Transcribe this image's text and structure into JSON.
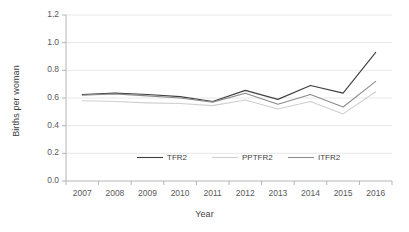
{
  "chart_data": {
    "type": "line",
    "title": "",
    "xlabel": "Year",
    "ylabel": "Births per woman",
    "categories": [
      "2007",
      "2008",
      "2009",
      "2010",
      "2011",
      "2012",
      "2013",
      "2014",
      "2015",
      "2016"
    ],
    "x": [
      2007,
      2008,
      2009,
      2010,
      2011,
      2012,
      2013,
      2014,
      2015,
      2016
    ],
    "ylim": [
      0.0,
      1.2
    ],
    "ytick_labels": [
      "0.0",
      "0.2",
      "0.4",
      "0.6",
      "0.8",
      "1.0",
      "1.2"
    ],
    "ytick_values": [
      0.0,
      0.2,
      0.4,
      0.6,
      0.8,
      1.0,
      1.2
    ],
    "grid": "horizontal",
    "legend_position": "inside-bottom-center",
    "series": [
      {
        "name": "TFR2",
        "color": "#3f3f3f",
        "values": [
          0.625,
          0.635,
          0.625,
          0.61,
          0.575,
          0.655,
          0.59,
          0.69,
          0.635,
          0.93
        ]
      },
      {
        "name": "PPTFR2",
        "color": "#cfcfcf",
        "values": [
          0.58,
          0.575,
          0.565,
          0.56,
          0.545,
          0.585,
          0.52,
          0.575,
          0.485,
          0.645
        ]
      },
      {
        "name": "ITFR2",
        "color": "#8c8c8c",
        "values": [
          0.62,
          0.63,
          0.615,
          0.6,
          0.57,
          0.635,
          0.555,
          0.625,
          0.535,
          0.72
        ]
      }
    ]
  },
  "axes": {
    "y_title": "Births per woman",
    "x_title": "Year"
  },
  "style": {
    "grid_color": "#e8e8e8",
    "axis_color": "#b5b5b5",
    "text_color": "#59595b"
  }
}
